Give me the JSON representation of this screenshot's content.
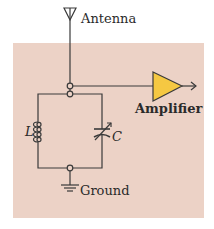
{
  "diagram": {
    "type": "LC tank circuit (radio tuner)",
    "colors": {
      "background": "#ffffff",
      "panel": "#ecd2c6",
      "wire": "#3a3a3a",
      "amplifier_fill": "#f5c842",
      "amplifier_stroke": "#3a3a3a"
    },
    "labels": {
      "antenna": "Antenna",
      "amplifier": "Amplifier",
      "inductor": "L",
      "capacitor": "C",
      "ground": "Ground"
    },
    "components": [
      {
        "id": "antenna",
        "symbol": "antenna-icon"
      },
      {
        "id": "inductor",
        "symbol": "inductor-coil-icon",
        "label": "L"
      },
      {
        "id": "capacitor",
        "symbol": "variable-capacitor-icon",
        "label": "C"
      },
      {
        "id": "amplifier",
        "symbol": "amplifier-triangle-icon"
      },
      {
        "id": "ground",
        "symbol": "ground-icon"
      }
    ],
    "connections": [
      "antenna -> top node",
      "top node -> amplifier input",
      "top node -> inductor || capacitor",
      "inductor || capacitor -> bottom node -> ground",
      "amplifier -> output arrow"
    ]
  }
}
